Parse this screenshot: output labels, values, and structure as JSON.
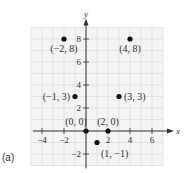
{
  "chart_data": {
    "type": "scatter",
    "title": "",
    "panel_label": "(a)",
    "xlabel": "x",
    "ylabel": "y",
    "xlim": [
      -5,
      7
    ],
    "ylim": [
      -3,
      9
    ],
    "grid": true,
    "x_ticks": [
      -4,
      -2,
      2,
      4,
      6
    ],
    "y_ticks": [
      -2,
      2,
      4,
      6,
      8
    ],
    "points": [
      {
        "x": -2,
        "y": 8,
        "label": "(−2, 8)",
        "anchor": "below"
      },
      {
        "x": 4,
        "y": 8,
        "label": "(4, 8)",
        "anchor": "below"
      },
      {
        "x": -1,
        "y": 3,
        "label": "(−1, 3)",
        "anchor": "left"
      },
      {
        "x": 3,
        "y": 3,
        "label": "(3, 3)",
        "anchor": "right"
      },
      {
        "x": 0,
        "y": 0,
        "label": "(0, 0)",
        "anchor": "above-left"
      },
      {
        "x": 2,
        "y": 0,
        "label": "(2, 0)",
        "anchor": "above"
      },
      {
        "x": 1,
        "y": -1,
        "label": "(1, −1)",
        "anchor": "below-right"
      }
    ]
  }
}
